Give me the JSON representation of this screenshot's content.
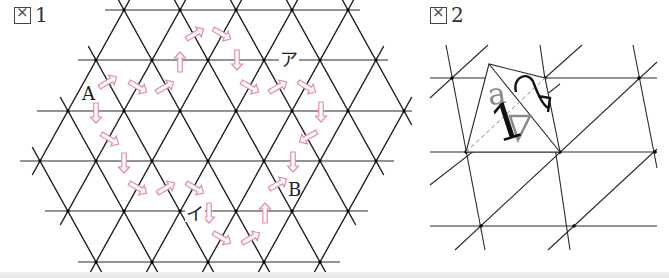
{
  "figure1": {
    "label": "図 1",
    "label_prefix": "図",
    "label_number": "1",
    "line_color": "#2a2a2a",
    "arrow_color": "#e38ea4",
    "grid": {
      "rows": [
        {
          "y": 10,
          "x1": 105,
          "x2": 360,
          "nodes": [
            124,
            180,
            236,
            292,
            348
          ]
        },
        {
          "y": 60,
          "x1": 78,
          "x2": 388,
          "nodes": [
            96,
            152,
            208,
            264,
            320,
            376
          ]
        },
        {
          "y": 111,
          "x1": 37,
          "x2": 412,
          "nodes": [
            68,
            124,
            180,
            236,
            292,
            348,
            404
          ]
        },
        {
          "y": 161,
          "x1": 20,
          "x2": 394,
          "nodes": [
            40,
            96,
            152,
            208,
            264,
            320,
            376
          ]
        },
        {
          "y": 211,
          "x1": 45,
          "x2": 368,
          "nodes": [
            68,
            124,
            180,
            236,
            292,
            348
          ]
        },
        {
          "y": 262,
          "x1": 78,
          "x2": 340,
          "nodes": [
            96,
            152,
            208,
            264,
            320
          ]
        }
      ]
    },
    "points": [
      {
        "name": "A",
        "text": "A",
        "x": 82,
        "y": 100
      },
      {
        "name": "B",
        "text": "B",
        "x": 288,
        "y": 196
      },
      {
        "name": "a",
        "text": "ア",
        "x": 280,
        "y": 66
      },
      {
        "name": "i",
        "text": "イ",
        "x": 186,
        "y": 220
      }
    ],
    "arrows": [
      {
        "x": 108,
        "y": 82,
        "dir": "ur"
      },
      {
        "x": 138,
        "y": 87,
        "dir": "dr"
      },
      {
        "x": 165,
        "y": 87,
        "dir": "ur"
      },
      {
        "x": 180,
        "y": 62,
        "dir": "u"
      },
      {
        "x": 195,
        "y": 34,
        "dir": "ur"
      },
      {
        "x": 222,
        "y": 34,
        "dir": "dr"
      },
      {
        "x": 237,
        "y": 60,
        "dir": "d"
      },
      {
        "x": 250,
        "y": 87,
        "dir": "dr"
      },
      {
        "x": 278,
        "y": 87,
        "dir": "ur"
      },
      {
        "x": 307,
        "y": 87,
        "dir": "dr"
      },
      {
        "x": 321,
        "y": 112,
        "dir": "d"
      },
      {
        "x": 308,
        "y": 137,
        "dir": "dl"
      },
      {
        "x": 293,
        "y": 162,
        "dir": "d"
      },
      {
        "x": 278,
        "y": 184,
        "dir": "ur"
      },
      {
        "x": 96,
        "y": 113,
        "dir": "d"
      },
      {
        "x": 110,
        "y": 139,
        "dir": "dr"
      },
      {
        "x": 124,
        "y": 163,
        "dir": "d"
      },
      {
        "x": 138,
        "y": 188,
        "dir": "dr"
      },
      {
        "x": 166,
        "y": 188,
        "dir": "ur"
      },
      {
        "x": 195,
        "y": 188,
        "dir": "dr"
      },
      {
        "x": 209,
        "y": 213,
        "dir": "d"
      },
      {
        "x": 222,
        "y": 238,
        "dir": "dr"
      },
      {
        "x": 251,
        "y": 238,
        "dir": "ur"
      },
      {
        "x": 265,
        "y": 213,
        "dir": "u"
      }
    ]
  },
  "figure2": {
    "label": "図 2",
    "label_prefix": "図",
    "label_number": "2",
    "line_color": "#2a2a2a",
    "ghost_color": "#8a8a8a",
    "horizontal_lines": [
      {
        "y": 78,
        "x1": 10,
        "x2": 237
      },
      {
        "y": 152,
        "x1": 10,
        "x2": 237
      },
      {
        "y": 226,
        "x1": 10,
        "x2": 237
      }
    ],
    "steep_lines": [
      {
        "x1": 26,
        "y1": 45,
        "x2": 65,
        "y2": 250
      },
      {
        "x1": 120,
        "y1": 45,
        "x2": 150,
        "y2": 250
      },
      {
        "x1": 213,
        "y1": 45,
        "x2": 237,
        "y2": 168
      }
    ],
    "diagonal_lines": [
      {
        "x1": 10,
        "y1": 98,
        "x2": 68,
        "y2": 45
      },
      {
        "x1": 125,
        "y1": 78,
        "x2": 162,
        "y2": 45
      },
      {
        "x1": 10,
        "y1": 185,
        "x2": 140,
        "y2": 84
      },
      {
        "x1": 35,
        "y1": 250,
        "x2": 237,
        "y2": 62
      },
      {
        "x1": 128,
        "y1": 250,
        "x2": 237,
        "y2": 149
      }
    ],
    "nodes": [
      {
        "x": 32,
        "y": 78
      },
      {
        "x": 125,
        "y": 78
      },
      {
        "x": 219,
        "y": 78
      },
      {
        "x": 46,
        "y": 152
      },
      {
        "x": 140,
        "y": 152
      },
      {
        "x": 235,
        "y": 152
      },
      {
        "x": 61,
        "y": 226
      },
      {
        "x": 154,
        "y": 226
      }
    ],
    "folded_flap": {
      "apex": {
        "x": 69,
        "y": 64
      },
      "right": {
        "x": 125,
        "y": 78
      },
      "crease_end": {
        "x": 140,
        "y": 152
      },
      "left": {
        "x": 46,
        "y": 152
      }
    },
    "dashed_line": {
      "x1": 46,
      "y1": 152,
      "x2": 125,
      "y2": 78
    },
    "glyph_text": "1",
    "glyph_ghost_text": "a"
  }
}
